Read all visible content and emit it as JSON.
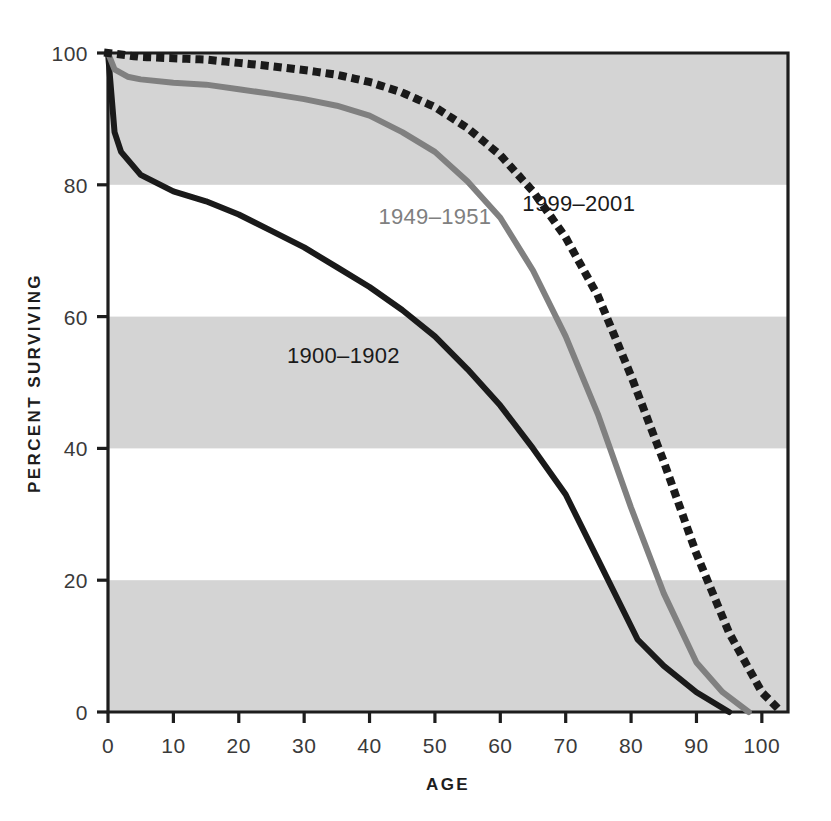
{
  "chart_data": {
    "type": "line",
    "title": "",
    "xlabel": "AGE",
    "ylabel": "PERCENT SURVIVING",
    "xlim": [
      0,
      104
    ],
    "ylim": [
      0,
      100
    ],
    "grid": "horizontal-alternating-bands",
    "legend_position": "inline-annotations",
    "x_ticks": [
      0,
      10,
      20,
      30,
      40,
      50,
      60,
      70,
      80,
      90,
      100
    ],
    "x_tick_labels": [
      "0",
      "10",
      "20",
      "30",
      "40",
      "50",
      "60",
      "70",
      "80",
      "90",
      "100"
    ],
    "y_ticks": [
      0,
      20,
      40,
      60,
      80,
      100
    ],
    "y_tick_labels": [
      "0",
      "20",
      "40",
      "60",
      "80",
      "100"
    ],
    "shaded_bands": [
      [
        80,
        100
      ],
      [
        40,
        60
      ],
      [
        0,
        20
      ]
    ],
    "band_color": "#d4d4d4",
    "series": [
      {
        "name": "1900-1902",
        "label": "1900–1902",
        "color": "#1a1a1a",
        "style": "solid",
        "width": 6,
        "label_x": 36,
        "label_y": 53,
        "x": [
          0,
          1,
          2,
          5,
          10,
          15,
          20,
          25,
          30,
          35,
          40,
          45,
          50,
          55,
          60,
          65,
          70,
          75,
          81,
          85,
          90,
          95
        ],
        "values": [
          100,
          88,
          85,
          81.5,
          79,
          77.5,
          75.5,
          73,
          70.5,
          67.5,
          64.5,
          61,
          57,
          52,
          46.5,
          40,
          33,
          23,
          11,
          7,
          3,
          0
        ]
      },
      {
        "name": "1949-1951",
        "label": "1949–1951",
        "color": "#808080",
        "style": "solid",
        "width": 6,
        "label_x": 50,
        "label_y": 74,
        "x": [
          0,
          1,
          3,
          5,
          10,
          15,
          20,
          25,
          30,
          35,
          40,
          45,
          50,
          55,
          60,
          65,
          70,
          75,
          80,
          85,
          90,
          94,
          98
        ],
        "values": [
          100,
          97.5,
          96.4,
          96,
          95.5,
          95.2,
          94.5,
          93.8,
          93,
          92,
          90.5,
          88,
          85,
          80.5,
          75,
          67,
          57,
          45,
          31,
          18,
          7.5,
          3,
          0
        ]
      },
      {
        "name": "1999-2001",
        "label": "1999–2001",
        "color": "#1a1a1a",
        "style": "dotted",
        "width": 7,
        "label_x": 72,
        "label_y": 76,
        "x": [
          0,
          5,
          10,
          15,
          20,
          25,
          30,
          35,
          40,
          45,
          50,
          55,
          60,
          65,
          70,
          75,
          80,
          85,
          90,
          95,
          100,
          103
        ],
        "values": [
          100,
          99.4,
          99.2,
          99,
          98.5,
          98,
          97.4,
          96.7,
          95.6,
          94,
          91.8,
          88.6,
          84.5,
          79,
          72,
          63,
          51,
          38,
          24,
          12,
          3,
          0
        ]
      }
    ]
  }
}
